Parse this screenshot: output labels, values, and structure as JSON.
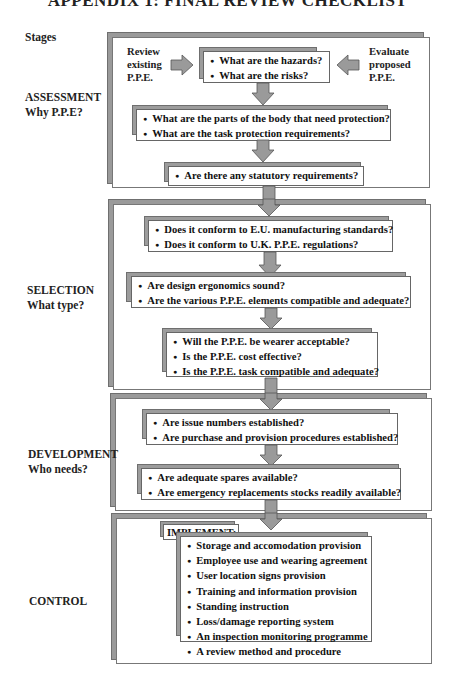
{
  "title": "APPENDIX 1: FINAL REVIEW CHECKLIST",
  "stages_heading": "Stages",
  "stages": [
    {
      "name": "ASSESSMENT",
      "subtitle": "Why P.P.E?",
      "side_left": [
        "Review",
        "existing",
        "P.P.E."
      ],
      "side_right": [
        "Evaluate",
        "proposed",
        "P.P.E."
      ],
      "boxes": [
        {
          "items": [
            "What are the hazards?",
            "What are the risks?"
          ]
        },
        {
          "items": [
            "What are the parts of the body that need protection?",
            "What are the task protection requirements?"
          ]
        },
        {
          "items": [
            "Are there any statutory requirements?"
          ]
        }
      ]
    },
    {
      "name": "SELECTION",
      "subtitle": "What type?",
      "boxes": [
        {
          "items": [
            "Does it conform to E.U. manufacturing standards?",
            "Does it conform to U.K. P.P.E. regulations?"
          ]
        },
        {
          "items": [
            "Are design ergonomics sound?",
            "Are the various P.P.E. elements compatible and adequate?"
          ]
        },
        {
          "items": [
            "Will the P.P.E. be wearer acceptable?",
            "Is the P.P.E. cost effective?",
            "Is the P.P.E. task compatible and adequate?"
          ]
        }
      ]
    },
    {
      "name": "DEVELOPMENT",
      "subtitle": "Who needs?",
      "boxes": [
        {
          "items": [
            "Are issue numbers established?",
            "Are purchase and provision procedures established?"
          ]
        },
        {
          "items": [
            "Are adequate spares available?",
            "Are emergency replacements stocks readily available?"
          ]
        }
      ]
    },
    {
      "name": "CONTROL",
      "subtitle": "",
      "implement_label": "IMPLEMENT:-",
      "boxes": [
        {
          "items": [
            "Storage and accomodation provision",
            "Employee use and wearing agreement",
            "User location signs provision",
            "Training and information provision",
            "Standing instruction",
            "Loss/damage reporting system",
            "An inspection monitoring programme",
            "A review method and procedure"
          ]
        }
      ]
    }
  ],
  "colors": {
    "arrow_fill": "#9a9a9a",
    "arrow_stroke": "#555555",
    "shadow": "#9a9a9a",
    "border": "#666666"
  }
}
